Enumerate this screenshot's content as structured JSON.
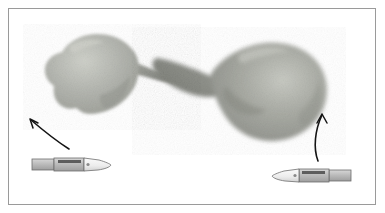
{
  "figure": {
    "title": "Two excised tissue specimens with curved orientation arrows and scalpel scale references",
    "caption": "",
    "background_color": "#ffffff",
    "border_color": "#9a9a9a",
    "border_inset_px": 8
  },
  "specimens": [
    {
      "id": "specimen-left",
      "label": "left specimen mass",
      "description": "Irregular grainy grey-green mass with a tapering tail directed to the lower right",
      "fill_color": "#b0b2ac",
      "shadow_color": "#8e9089",
      "highlight_color": "#c9cbc4",
      "bbox": {
        "x": 38,
        "y": 33,
        "width": 145,
        "height": 86
      }
    },
    {
      "id": "specimen-right",
      "label": "right specimen mass",
      "description": "Larger bulbous grainy grey mass with a pointed tail directed to the upper left",
      "fill_color": "#a8aaa3",
      "shadow_color": "#84867f",
      "highlight_color": "#c4c6bf",
      "bbox": {
        "x": 150,
        "y": 38,
        "width": 175,
        "height": 104
      }
    }
  ],
  "arrows": [
    {
      "id": "arrow-left",
      "label": "left orientation arrow",
      "direction": "up-left",
      "color": "#141414",
      "start": {
        "x": 68,
        "y": 148
      },
      "end": {
        "x": 28,
        "y": 118
      }
    },
    {
      "id": "arrow-right",
      "label": "right orientation arrow",
      "direction": "up",
      "color": "#141414",
      "start": {
        "x": 318,
        "y": 160
      },
      "end": {
        "x": 322,
        "y": 113
      }
    }
  ],
  "scalpels": [
    {
      "id": "scalpel-left",
      "label": "left scalpel scale reference",
      "orientation": "blade-right",
      "handle_color": "#b8b8b8",
      "blade_color": "#efefef",
      "outline_color": "#6d6d6d",
      "bbox": {
        "x": 32,
        "y": 156,
        "width": 79,
        "height": 17
      }
    },
    {
      "id": "scalpel-right",
      "label": "right scalpel scale reference",
      "orientation": "blade-left",
      "handle_color": "#b8b8b8",
      "blade_color": "#efefef",
      "outline_color": "#6d6d6d",
      "bbox": {
        "x": 272,
        "y": 167,
        "width": 79,
        "height": 17
      }
    }
  ]
}
